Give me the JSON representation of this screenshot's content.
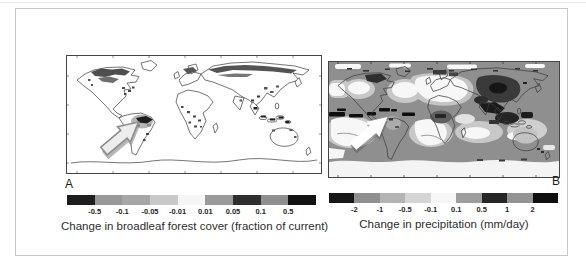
{
  "figure": {
    "panels": [
      {
        "label": "A",
        "caption": "Change in broadleaf forest cover (fraction of current)",
        "colorbar": {
          "ticks": [
            "-0.5",
            "-0.1",
            "-0.05",
            "-0.01",
            "0.01",
            "0.05",
            "0.1",
            "0.5"
          ],
          "segment_colors": [
            "#1d1d1d",
            "#989898",
            "#a6a6a6",
            "#c9c9c9",
            "#f6f6f6",
            "#9b9b9b",
            "#2e2e2e",
            "#909090",
            "#121212"
          ]
        },
        "annotation_arrow": "gray-block-arrow-pointing-northeast-at-amazon"
      },
      {
        "label": "B",
        "caption": "Change in precipitation (mm/day)",
        "colorbar": {
          "ticks": [
            "-2",
            "-1",
            "-0.5",
            "-0.1",
            "0.1",
            "0.5",
            "1",
            "2"
          ],
          "segment_colors": [
            "#171717",
            "#8f8f8f",
            "#b3b3b3",
            "#d5d5d5",
            "#f7f7f7",
            "#9d9d9d",
            "#262626",
            "#939393",
            "#0f0f0f"
          ]
        },
        "annotation_arrow": "white-block-arrow-pointing-northeast-at-south-america"
      }
    ]
  }
}
